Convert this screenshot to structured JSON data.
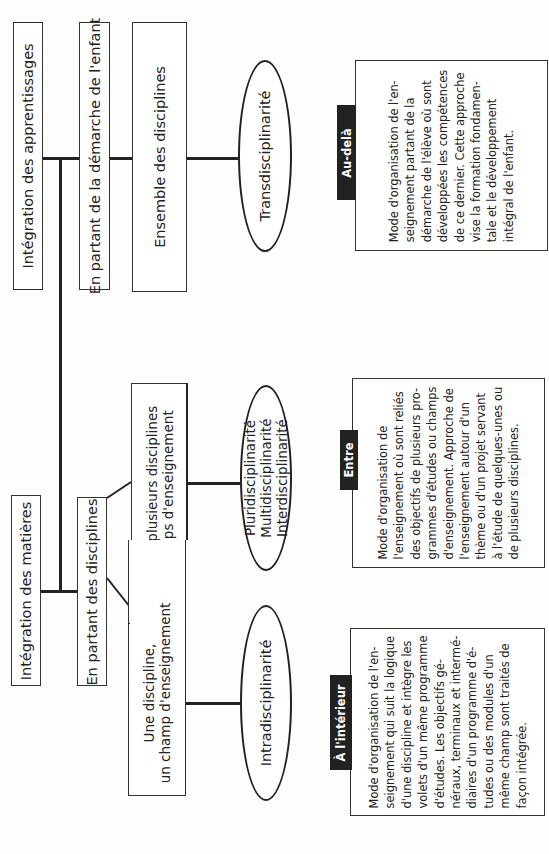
{
  "diagram": {
    "top_branch": {
      "root": "Intégration des apprentissages",
      "approach": "En partant de la démarche de l'enfant",
      "scope": "Ensemble des disciplines",
      "type": "Transdisciplinarité",
      "tab": "Au-delà",
      "description": [
        "Mode d'organisation de l'en-",
        "seignement partant de la",
        "démarche de l'élève où sont",
        "développées les compétences",
        "de ce dernier. Cette approche",
        "vise la formation fondamen-",
        "tale et le développement",
        "intégral de l'enfant."
      ]
    },
    "bottom_branch": {
      "root": "Intégration des matières",
      "approach": "En partant des disciplines",
      "middle": {
        "scope": [
          "Deux ou plusieurs disciplines",
          "ou champs d'enseignement"
        ],
        "types": [
          "Pluridisciplinarité",
          "Multidisciplinarité",
          "Interdisciplinarité"
        ],
        "tab": "Entre",
        "description": [
          "Mode d'organisation de",
          "l'enseignement où sont reliés",
          "des objectifs de plusieurs pro-",
          "grammes d'études ou champs",
          "d'enseignement. Approche de",
          "l'enseignement autour d'un",
          "thème ou d'un projet servant",
          "à l'étude de quelques-unes ou",
          "de plusieurs disciplines."
        ]
      },
      "single": {
        "scope": [
          "Une discipline,",
          "un champ d'enseignement"
        ],
        "type": "Intradisciplinarité",
        "tab": "À l'intérieur",
        "description": [
          "Mode d'organisation de l'en-",
          "seignement qui suit la logique",
          "d'une discipline et intègre les",
          "volets d'un même programme",
          "d'études. Les objectifs gé-",
          "néraux, terminaux et intermé-",
          "diaires d'un programme d'é-",
          "tudes ou des modules d'un",
          "même champ sont traités de",
          "façon intégrée."
        ]
      }
    }
  }
}
